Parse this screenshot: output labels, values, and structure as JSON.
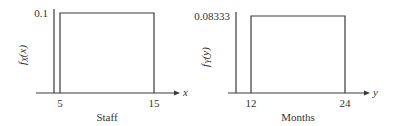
{
  "chart_data": [
    {
      "type": "line",
      "title": "",
      "distribution": "uniform",
      "xlabel": "Staff",
      "axis_var": "x",
      "ylabel": "f_X(x)",
      "ylabel_main": "f",
      "ylabel_sub": "X",
      "ylabel_arg": "(x)",
      "support": [
        5,
        15
      ],
      "density": 0.1,
      "x_ticks": [
        "5",
        "15"
      ],
      "y_ticks": [
        "0.1"
      ],
      "xlim": [
        3,
        17
      ],
      "ylim": [
        0,
        0.1
      ],
      "grid": false
    },
    {
      "type": "line",
      "title": "",
      "distribution": "uniform",
      "xlabel": "Months",
      "axis_var": "y",
      "ylabel": "f_Y(y)",
      "ylabel_main": "f",
      "ylabel_sub": "Y",
      "ylabel_arg": "(y)",
      "support": [
        12,
        24
      ],
      "density": 0.08333,
      "x_ticks": [
        "12",
        "24"
      ],
      "y_ticks": [
        "0.08333"
      ],
      "xlim": [
        10.5,
        26.5
      ],
      "ylim": [
        0,
        0.08333
      ],
      "grid": false
    }
  ]
}
